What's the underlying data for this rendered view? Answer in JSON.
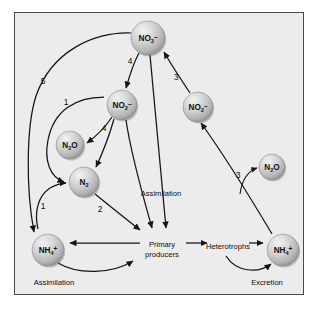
{
  "figure": {
    "background_color": "#ffffff",
    "panel_color": "#ececed",
    "border_color": "#4a4a4e",
    "ink_color": "#141418"
  },
  "nodes": [
    {
      "id": "nitrate-top",
      "formula": "NO",
      "sub": "3",
      "sup": "–",
      "x": 148,
      "y": 38,
      "r": 17
    },
    {
      "id": "nitrite-left",
      "formula": "NO",
      "sub": "2",
      "sup": "–",
      "x": 122,
      "y": 105,
      "r": 15
    },
    {
      "id": "nitrous-oxide-left",
      "formula": "N",
      "sub": "2",
      "sup": "O",
      "x": 70,
      "y": 145,
      "r": 14
    },
    {
      "id": "dinitrogen",
      "formula": "N",
      "sub": "2",
      "sup": "",
      "x": 84,
      "y": 182,
      "r": 15
    },
    {
      "id": "ammonium-left",
      "formula": "NH",
      "sub": "4",
      "sup": "+",
      "x": 48,
      "y": 250,
      "r": 16
    },
    {
      "id": "nitrite-right",
      "formula": "NO",
      "sub": "2",
      "sup": "–",
      "x": 198,
      "y": 107,
      "r": 15
    },
    {
      "id": "nitrous-oxide-right",
      "formula": "N",
      "sub": "2",
      "sup": "O",
      "x": 272,
      "y": 167,
      "r": 13
    },
    {
      "id": "ammonium-right",
      "formula": "NH",
      "sub": "4",
      "sup": "+",
      "x": 283,
      "y": 250,
      "r": 16
    }
  ],
  "flux_numbers": [
    {
      "id": "flux-5",
      "value": "5",
      "x": 43,
      "y": 84
    },
    {
      "id": "flux-1-upper",
      "value": "1",
      "x": 66,
      "y": 105
    },
    {
      "id": "flux-1-lower",
      "value": "1",
      "x": 43,
      "y": 209
    },
    {
      "id": "flux-4-upper",
      "value": "4",
      "x": 130,
      "y": 64
    },
    {
      "id": "flux-4-lower",
      "value": "4",
      "x": 104,
      "y": 131
    },
    {
      "id": "flux-2",
      "value": "2",
      "x": 100,
      "y": 212
    },
    {
      "id": "flux-3-upper",
      "value": "3",
      "x": 176,
      "y": 80
    },
    {
      "id": "flux-3-lower",
      "value": "3",
      "x": 238,
      "y": 178
    }
  ],
  "process_labels": [
    {
      "id": "assimilation-center",
      "text": "Assimilation",
      "x": 161,
      "y": 196
    },
    {
      "id": "assimilation-bottom",
      "text": "Assimilation",
      "x": 54,
      "y": 285
    },
    {
      "id": "excretion-bottom",
      "text": "Excretion",
      "x": 267,
      "y": 285
    }
  ],
  "compartments": [
    {
      "id": "primary-producers",
      "line1": "Primary",
      "line2": "producers",
      "x": 162,
      "y": 247
    },
    {
      "id": "heterotrophs",
      "line1": "Heterotrophs",
      "line2": "",
      "x": 228,
      "y": 249
    }
  ]
}
